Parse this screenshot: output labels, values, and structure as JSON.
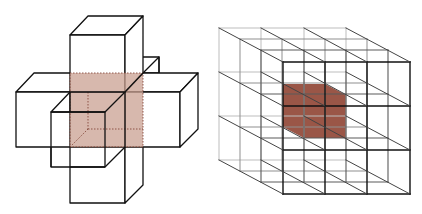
{
  "figure": {
    "panels": [
      {
        "id": "left",
        "description": "von Neumann neighborhood: central cube with six face-adjacent cubes",
        "highlight_color": "#c9a092",
        "line_color": "#111111"
      },
      {
        "id": "right",
        "description": "3x3x3 lattice of cubes with shaded central cube",
        "highlight_color": "#8c3f2e",
        "line_color": "#222222"
      }
    ]
  }
}
